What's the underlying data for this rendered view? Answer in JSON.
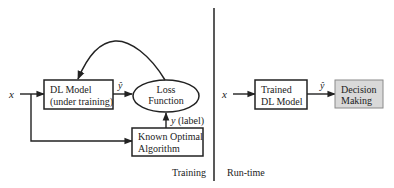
{
  "training": {
    "input_label": "x",
    "model_box": {
      "line1": "DL Model",
      "line2": "(under training)"
    },
    "prediction_label": "ŷ",
    "loss_box": {
      "line1": "Loss",
      "line2": "Function"
    },
    "label_edge": "y (label)",
    "optimal_box": {
      "line1": "Known Optimal",
      "line2": "Algorithm"
    },
    "section_label": "Training"
  },
  "runtime": {
    "input_label": "x",
    "model_box": {
      "line1": "Trained",
      "line2": "DL Model"
    },
    "prediction_label": "ŷ",
    "decision_box": {
      "line1": "Decision",
      "line2": "Making"
    },
    "section_label": "Run-time"
  },
  "colors": {
    "stroke": "#222222",
    "decision_fill": "#d9d9d9",
    "decision_border": "#8a8a8a"
  }
}
